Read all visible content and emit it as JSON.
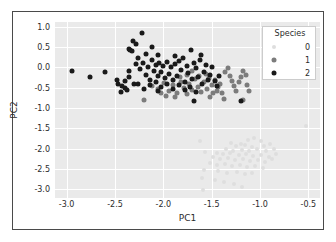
{
  "chart_data": {
    "type": "scatter",
    "title": "",
    "xlabel": "PC1",
    "ylabel": "PC2",
    "xlim": [
      -3.12,
      -0.38
    ],
    "ylim": [
      -3.22,
      1.12
    ],
    "xticks": [
      "-3.0",
      "-2.5",
      "-2.0",
      "-1.5",
      "-1.0",
      "-0.5"
    ],
    "xtick_values": [
      -3.0,
      -2.5,
      -2.0,
      -1.5,
      -1.0,
      -0.5
    ],
    "yticks": [
      "1.0",
      "0.5",
      "0.0",
      "-0.5",
      "-1.0",
      "-1.5",
      "-2.0",
      "-2.5",
      "-3.0"
    ],
    "ytick_values": [
      1.0,
      0.5,
      0.0,
      -0.5,
      -1.0,
      -1.5,
      -2.0,
      -2.5,
      -3.0
    ],
    "grid": true,
    "legend": {
      "title": "Species",
      "position": "upper-right",
      "entries": [
        {
          "label": "0",
          "color": "#dedede"
        },
        {
          "label": "1",
          "color": "#7c7c7c"
        },
        {
          "label": "2",
          "color": "#1a1a1a"
        }
      ]
    },
    "series": [
      {
        "name": "0",
        "color": "#dedede",
        "points": [
          [
            -0.52,
            -1.45
          ],
          [
            -1.62,
            -1.82
          ],
          [
            -1.3,
            -1.86
          ],
          [
            -1.12,
            -1.79
          ],
          [
            -1.06,
            -1.74
          ],
          [
            -0.99,
            -1.82
          ],
          [
            -1.2,
            -1.88
          ],
          [
            -1.25,
            -1.95
          ],
          [
            -1.16,
            -1.92
          ],
          [
            -1.08,
            -1.97
          ],
          [
            -0.96,
            -1.93
          ],
          [
            -0.9,
            -1.88
          ],
          [
            -1.35,
            -2.0
          ],
          [
            -1.28,
            -2.05
          ],
          [
            -1.19,
            -2.04
          ],
          [
            -1.11,
            -2.07
          ],
          [
            -1.03,
            -2.02
          ],
          [
            -0.94,
            -2.06
          ],
          [
            -0.86,
            -2.01
          ],
          [
            -1.44,
            -2.1
          ],
          [
            -1.38,
            -2.14
          ],
          [
            -1.31,
            -2.12
          ],
          [
            -1.22,
            -2.16
          ],
          [
            -1.15,
            -2.13
          ],
          [
            -1.07,
            -2.18
          ],
          [
            -0.99,
            -2.15
          ],
          [
            -0.91,
            -2.2
          ],
          [
            -0.83,
            -2.13
          ],
          [
            -1.57,
            -2.08
          ],
          [
            -1.49,
            -2.22
          ],
          [
            -1.41,
            -2.26
          ],
          [
            -1.33,
            -2.24
          ],
          [
            -1.26,
            -2.29
          ],
          [
            -1.18,
            -2.26
          ],
          [
            -1.1,
            -2.31
          ],
          [
            -1.02,
            -2.28
          ],
          [
            -0.95,
            -2.33
          ],
          [
            -0.88,
            -2.27
          ],
          [
            -1.52,
            -2.36
          ],
          [
            -1.45,
            -2.4
          ],
          [
            -1.36,
            -2.38
          ],
          [
            -1.29,
            -2.44
          ],
          [
            -1.21,
            -2.41
          ],
          [
            -1.13,
            -2.46
          ],
          [
            -1.05,
            -2.43
          ],
          [
            -0.97,
            -2.48
          ],
          [
            -1.58,
            -2.52
          ],
          [
            -1.43,
            -2.56
          ],
          [
            -1.34,
            -2.6
          ],
          [
            -1.24,
            -2.58
          ],
          [
            -1.16,
            -2.64
          ],
          [
            -1.08,
            -2.61
          ],
          [
            -1.6,
            -2.72
          ],
          [
            -1.47,
            -2.78
          ],
          [
            -1.37,
            -2.83
          ],
          [
            -1.27,
            -2.88
          ],
          [
            -1.19,
            -2.95
          ],
          [
            -1.59,
            -3.02
          ]
        ]
      },
      {
        "name": "1",
        "color": "#7c7c7c",
        "points": [
          [
            -2.2,
            -0.8
          ],
          [
            -2.12,
            -0.46
          ],
          [
            -2.05,
            -0.52
          ],
          [
            -1.99,
            -0.38
          ],
          [
            -1.94,
            -0.58
          ],
          [
            -1.9,
            -0.44
          ],
          [
            -1.86,
            -0.62
          ],
          [
            -1.82,
            -0.35
          ],
          [
            -1.79,
            -0.5
          ],
          [
            -1.76,
            -0.66
          ],
          [
            -1.73,
            -0.41
          ],
          [
            -1.7,
            -0.56
          ],
          [
            -1.67,
            -0.29
          ],
          [
            -1.64,
            -0.48
          ],
          [
            -1.61,
            -0.61
          ],
          [
            -1.58,
            -0.37
          ],
          [
            -1.55,
            -0.53
          ],
          [
            -1.52,
            -0.72
          ],
          [
            -1.5,
            -0.44
          ],
          [
            -1.47,
            -0.31
          ],
          [
            -1.45,
            -0.58
          ],
          [
            -1.43,
            -0.48
          ],
          [
            -1.41,
            -0.4
          ],
          [
            -1.39,
            -0.63
          ],
          [
            -1.36,
            -0.12
          ],
          [
            -1.33,
            -0.02
          ],
          [
            -1.31,
            -0.2
          ],
          [
            -1.29,
            -0.33
          ],
          [
            -1.27,
            -0.46
          ],
          [
            -1.25,
            -0.58
          ],
          [
            -1.22,
            -0.36
          ],
          [
            -1.2,
            -0.24
          ],
          [
            -1.18,
            -0.08
          ],
          [
            -1.15,
            -0.18
          ],
          [
            -1.13,
            -0.44
          ],
          [
            -1.11,
            -0.57
          ],
          [
            -1.18,
            -0.8
          ],
          [
            -1.37,
            -0.79
          ],
          [
            -1.88,
            -0.74
          ],
          [
            -1.97,
            -0.7
          ],
          [
            -2.02,
            -0.64
          ],
          [
            -1.83,
            -0.24
          ],
          [
            -1.76,
            -0.18
          ],
          [
            -1.7,
            -0.1
          ],
          [
            -1.63,
            -0.22
          ],
          [
            -1.56,
            -0.15
          ],
          [
            -1.49,
            -0.64
          ],
          [
            -1.53,
            -0.26
          ]
        ]
      },
      {
        "name": "2",
        "color": "#1a1a1a",
        "points": [
          [
            -2.94,
            -0.1
          ],
          [
            -2.76,
            -0.23
          ],
          [
            -2.6,
            -0.12
          ],
          [
            -2.47,
            -0.42
          ],
          [
            -2.43,
            -0.45
          ],
          [
            -2.4,
            -0.5
          ],
          [
            -2.36,
            0.46
          ],
          [
            -2.34,
            0.44
          ],
          [
            -2.32,
            0.41
          ],
          [
            -2.31,
            0.66
          ],
          [
            -2.28,
            0.58
          ],
          [
            -2.22,
            0.86
          ],
          [
            -2.18,
            0.32
          ],
          [
            -2.12,
            0.5
          ],
          [
            -2.4,
            -0.33
          ],
          [
            -2.35,
            -0.24
          ],
          [
            -2.3,
            -0.4
          ],
          [
            -2.28,
            0.08
          ],
          [
            -2.24,
            -0.05
          ],
          [
            -2.21,
            0.12
          ],
          [
            -2.18,
            -0.18
          ],
          [
            -2.16,
            0.02
          ],
          [
            -2.14,
            -0.3
          ],
          [
            -2.12,
            0.18
          ],
          [
            -2.1,
            -0.08
          ],
          [
            -2.08,
            0.06
          ],
          [
            -2.06,
            -0.22
          ],
          [
            -2.04,
            0.1
          ],
          [
            -2.02,
            -0.12
          ],
          [
            -2.0,
            0.04
          ],
          [
            -1.98,
            -0.26
          ],
          [
            -1.96,
            0.14
          ],
          [
            -1.94,
            -0.16
          ],
          [
            -1.92,
            0.0
          ],
          [
            -1.9,
            -0.3
          ],
          [
            -1.88,
            0.08
          ],
          [
            -1.86,
            -0.2
          ],
          [
            -1.84,
            0.16
          ],
          [
            -1.82,
            -0.06
          ],
          [
            -1.8,
            0.22
          ],
          [
            -1.78,
            -0.36
          ],
          [
            -1.76,
            0.04
          ],
          [
            -1.74,
            -0.14
          ],
          [
            -1.71,
            0.42
          ],
          [
            -1.7,
            -0.28
          ],
          [
            -1.68,
            0.1
          ],
          [
            -1.66,
            -0.02
          ],
          [
            -1.64,
            -0.24
          ],
          [
            -1.62,
            0.18
          ],
          [
            -1.6,
            -0.4
          ],
          [
            -1.58,
            -0.12
          ],
          [
            -1.56,
            0.06
          ],
          [
            -1.54,
            -0.3
          ],
          [
            -1.52,
            -0.18
          ],
          [
            -1.5,
            0.02
          ],
          [
            -1.47,
            -0.34
          ],
          [
            -1.44,
            -0.46
          ],
          [
            -1.42,
            -0.21
          ],
          [
            -2.44,
            -0.6
          ],
          [
            -2.38,
            -0.56
          ],
          [
            -2.26,
            -0.42
          ],
          [
            -2.2,
            -0.52
          ],
          [
            -2.14,
            -0.44
          ],
          [
            -2.08,
            -0.36
          ],
          [
            -2.02,
            -0.48
          ],
          [
            -1.96,
            -0.4
          ],
          [
            -1.9,
            -0.52
          ],
          [
            -1.84,
            -0.44
          ],
          [
            -1.78,
            -0.56
          ],
          [
            -1.72,
            -0.48
          ],
          [
            -1.66,
            -0.6
          ],
          [
            -2.35,
            -0.1
          ],
          [
            -2.26,
            0.22
          ],
          [
            -2.05,
            0.3
          ],
          [
            -1.88,
            0.28
          ],
          [
            -1.68,
            -0.84
          ],
          [
            -1.2,
            -0.82
          ],
          [
            -2.48,
            -0.3
          ],
          [
            -2.05,
            -0.58
          ],
          [
            -1.61,
            0.3
          ]
        ]
      }
    ]
  }
}
